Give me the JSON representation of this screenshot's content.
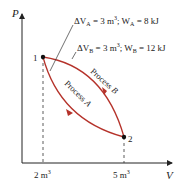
{
  "diagram": {
    "type": "pv-diagram",
    "axes": {
      "y_label": "P",
      "x_label": "V",
      "x_ticks": [
        "2 m³",
        "5 m³"
      ]
    },
    "points": [
      {
        "label": "1"
      },
      {
        "label": "2"
      }
    ],
    "processes": [
      {
        "label_main": "Process",
        "label_sub": "A"
      },
      {
        "label_main": "Process",
        "label_sub": "B"
      }
    ],
    "annotations": {
      "a": {
        "delta": "ΔV",
        "sub": "A",
        "eq": " = 3 m",
        "sup": "3",
        "rest": "; W",
        "wsub": "A",
        "wval": " = 8 kJ"
      },
      "b": {
        "delta": "ΔV",
        "sub": "B",
        "eq": " = 3 m",
        "sup": "3",
        "rest": "; W",
        "wsub": "B",
        "wval": " = 12 kJ"
      }
    },
    "colors": {
      "curve": "#b5322a",
      "axis": "#222222",
      "text": "#222222"
    }
  }
}
